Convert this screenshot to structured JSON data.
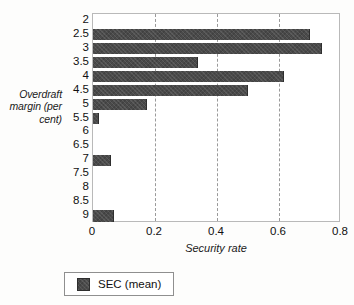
{
  "chart_data": {
    "type": "bar",
    "orientation": "horizontal",
    "title": "",
    "xlabel": "Security rate",
    "ylabel": "Overdraft margin (per cent)",
    "categories": [
      "2",
      "2.5",
      "3",
      "3.5",
      "4",
      "4.5",
      "5",
      "5.5",
      "6",
      "6.5",
      "7",
      "7.5",
      "8",
      "8.5",
      "9"
    ],
    "series": [
      {
        "name": "SEC (mean)",
        "values": [
          0,
          0.7,
          0.74,
          0.34,
          0.615,
          0.5,
          0.175,
          0.02,
          0,
          0,
          0.058,
          0,
          0,
          0,
          0.067
        ],
        "color": "#4a4a4a"
      }
    ],
    "xlim": [
      0,
      0.8
    ],
    "xticks": [
      0,
      0.2,
      0.4,
      0.6,
      0.8
    ],
    "xtick_labels": [
      "0",
      "0.2",
      "0.4",
      "0.6",
      "0.8"
    ],
    "gridlines": [
      0.2,
      0.4,
      0.6
    ],
    "grid": true,
    "grid_style": "dashed",
    "legend_position": "below",
    "legend_entries": [
      "SEC (mean)"
    ]
  },
  "axes": {
    "y_title": "Overdraft margin (per cent)",
    "x_title": "Security rate"
  },
  "legend": {
    "label": "SEC (mean)"
  }
}
